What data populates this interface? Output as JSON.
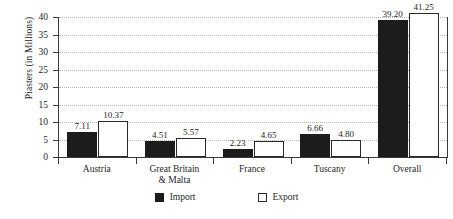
{
  "chart_data": {
    "type": "bar",
    "title": "",
    "xlabel": "",
    "ylabel": "Piasters (in Millions)",
    "categories": [
      "Austria",
      "Great Britain\n& Malta",
      "France",
      "Tuscany",
      "Overall"
    ],
    "series": [
      {
        "name": "Import",
        "values": [
          7.11,
          4.51,
          2.23,
          6.66,
          39.2
        ],
        "color": "#1c1c1c"
      },
      {
        "name": "Export",
        "values": [
          10.37,
          5.57,
          4.65,
          4.8,
          41.25
        ],
        "color": "#ffffff"
      }
    ],
    "value_labels": {
      "Austria": {
        "Import": "7.11",
        "Export": "10.37"
      },
      "Great Britain & Malta": {
        "Import": "4.51",
        "Export": "5.57"
      },
      "France": {
        "Import": "2.23",
        "Export": "4.65"
      },
      "Tuscany": {
        "Import": "6.66",
        "Export": "4.80"
      },
      "Overall": {
        "Import": "39.20",
        "Export": "41.25"
      }
    },
    "ylim": [
      0,
      40
    ],
    "yticks": [
      0,
      5,
      10,
      15,
      20,
      25,
      30,
      35,
      40
    ],
    "ytick_labels": [
      "0",
      "5",
      "10",
      "15",
      "20",
      "25",
      "30",
      "35",
      "40"
    ],
    "grid": true,
    "legend_position": "bottom"
  },
  "axes": {
    "y_title": "Piasters (in Millions)",
    "y_ticks": [
      {
        "value": 40,
        "label": "40"
      },
      {
        "value": 35,
        "label": "35"
      },
      {
        "value": 30,
        "label": "30"
      },
      {
        "value": 25,
        "label": "25"
      },
      {
        "value": 20,
        "label": "20"
      },
      {
        "value": 15,
        "label": "15"
      },
      {
        "value": 10,
        "label": "10"
      },
      {
        "value": 5,
        "label": "5"
      },
      {
        "value": 0,
        "label": "0"
      }
    ],
    "x_groups": [
      {
        "label_line1": "Austria",
        "label_line2": ""
      },
      {
        "label_line1": "Great Britain",
        "label_line2": "& Malta"
      },
      {
        "label_line1": "France",
        "label_line2": ""
      },
      {
        "label_line1": "Tuscany",
        "label_line2": ""
      },
      {
        "label_line1": "Overall",
        "label_line2": ""
      }
    ]
  },
  "bars": [
    {
      "group": "Austria",
      "series": "Import",
      "value": 7.11,
      "label": "7.11"
    },
    {
      "group": "Austria",
      "series": "Export",
      "value": 10.37,
      "label": "10.37"
    },
    {
      "group": "Great Britain & Malta",
      "series": "Import",
      "value": 4.51,
      "label": "4.51"
    },
    {
      "group": "Great Britain & Malta",
      "series": "Export",
      "value": 5.57,
      "label": "5.57"
    },
    {
      "group": "France",
      "series": "Import",
      "value": 2.23,
      "label": "2.23"
    },
    {
      "group": "France",
      "series": "Export",
      "value": 4.65,
      "label": "4.65"
    },
    {
      "group": "Tuscany",
      "series": "Import",
      "value": 6.66,
      "label": "6.66"
    },
    {
      "group": "Tuscany",
      "series": "Export",
      "value": 4.8,
      "label": "4.80"
    },
    {
      "group": "Overall",
      "series": "Import",
      "value": 39.2,
      "label": "39.20"
    },
    {
      "group": "Overall",
      "series": "Export",
      "value": 41.25,
      "label": "41.25"
    }
  ],
  "legend": {
    "items": [
      {
        "label": "Import",
        "style": "import"
      },
      {
        "label": "Export",
        "style": "export"
      }
    ]
  },
  "colors": {
    "import_fill": "#1c1c1c",
    "export_fill": "#ffffff",
    "axis": "#3a3a3a",
    "grid": "#b4b4b4",
    "text": "#262626",
    "background": "#ffffff"
  }
}
